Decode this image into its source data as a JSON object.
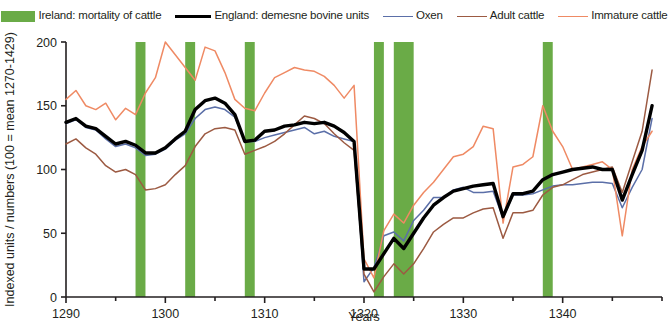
{
  "legend": {
    "items": [
      {
        "label": "Ireland: mortality of cattle",
        "marker": "swatch",
        "color": "#6aab47"
      },
      {
        "label": "England: demesne bovine units",
        "marker": "thick-line",
        "color": "#000000"
      },
      {
        "label": "Oxen",
        "marker": "thin-line",
        "color": "#5b6fa8"
      },
      {
        "label": "Adult cattle",
        "marker": "thin-line",
        "color": "#9c5a42"
      },
      {
        "label": "Immature cattle",
        "marker": "thin-line",
        "color": "#ef8a64"
      }
    ]
  },
  "chart_data": {
    "type": "line",
    "title": "",
    "xlabel": "Years",
    "ylabel": "Indexed units / numbers (100 = mean 1270-1429)",
    "xlim": [
      1290,
      1350
    ],
    "ylim": [
      0,
      200
    ],
    "xticks": [
      1290,
      1300,
      1310,
      1320,
      1330,
      1340
    ],
    "xminorticks": [
      1295,
      1305,
      1315,
      1325,
      1335,
      1345
    ],
    "yticks": [
      0,
      50,
      100,
      150,
      200
    ],
    "grid": false,
    "legend_position": "top",
    "x": [
      1290,
      1291,
      1292,
      1293,
      1294,
      1295,
      1296,
      1297,
      1298,
      1299,
      1300,
      1301,
      1302,
      1303,
      1304,
      1305,
      1306,
      1307,
      1308,
      1309,
      1310,
      1311,
      1312,
      1313,
      1314,
      1315,
      1316,
      1317,
      1318,
      1319,
      1320,
      1321,
      1322,
      1323,
      1324,
      1325,
      1326,
      1327,
      1328,
      1329,
      1330,
      1331,
      1332,
      1333,
      1334,
      1335,
      1336,
      1337,
      1338,
      1339,
      1340,
      1341,
      1342,
      1343,
      1344,
      1345,
      1346,
      1347,
      1348,
      1349
    ],
    "series": [
      {
        "name": "England: demesne bovine units",
        "color": "#000000",
        "width": 3.4,
        "values": [
          137,
          140,
          134,
          132,
          126,
          120,
          122,
          119,
          113,
          113,
          117,
          124,
          130,
          147,
          154,
          156,
          152,
          143,
          122,
          123,
          130,
          131,
          134,
          135,
          137,
          136,
          137,
          134,
          129,
          122,
          22,
          22,
          34,
          46,
          38,
          50,
          62,
          72,
          78,
          83,
          85,
          87,
          88,
          89,
          63,
          81,
          81,
          83,
          92,
          96,
          98,
          100,
          101,
          102,
          100,
          100,
          76,
          96,
          115,
          150
        ]
      },
      {
        "name": "Oxen",
        "color": "#5b6fa8",
        "width": 1.5,
        "values": [
          136,
          139,
          133,
          131,
          124,
          118,
          120,
          117,
          111,
          112,
          116,
          123,
          128,
          140,
          147,
          149,
          147,
          141,
          122,
          122,
          125,
          127,
          129,
          131,
          133,
          128,
          130,
          126,
          124,
          122,
          12,
          23,
          48,
          51,
          44,
          60,
          68,
          78,
          78,
          84,
          86,
          82,
          82,
          83,
          62,
          80,
          80,
          81,
          84,
          87,
          88,
          88,
          89,
          90,
          90,
          89,
          70,
          86,
          100,
          140
        ]
      },
      {
        "name": "Adult cattle",
        "color": "#9c5a42",
        "width": 1.5,
        "values": [
          120,
          124,
          117,
          112,
          103,
          98,
          100,
          96,
          84,
          85,
          88,
          96,
          103,
          118,
          128,
          132,
          133,
          131,
          112,
          115,
          118,
          122,
          128,
          135,
          142,
          140,
          136,
          128,
          121,
          115,
          18,
          4,
          16,
          26,
          18,
          26,
          38,
          51,
          57,
          62,
          62,
          66,
          69,
          70,
          46,
          66,
          66,
          68,
          80,
          86,
          88,
          92,
          96,
          98,
          100,
          102,
          82,
          106,
          130,
          178
        ]
      },
      {
        "name": "Immature cattle",
        "color": "#ef8a64",
        "width": 1.5,
        "values": [
          155,
          162,
          150,
          147,
          152,
          139,
          148,
          143,
          160,
          172,
          200,
          190,
          180,
          170,
          196,
          193,
          176,
          155,
          148,
          146,
          160,
          172,
          176,
          180,
          178,
          177,
          173,
          166,
          156,
          166,
          30,
          15,
          52,
          65,
          58,
          72,
          82,
          90,
          100,
          110,
          112,
          118,
          134,
          132,
          58,
          102,
          104,
          110,
          150,
          130,
          118,
          100,
          102,
          104,
          106,
          100,
          48,
          100,
          118,
          130
        ]
      }
    ],
    "bands": {
      "name": "Ireland: mortality of cattle",
      "color": "#6aab47",
      "ranges": [
        [
          1297,
          1298
        ],
        [
          1302,
          1303
        ],
        [
          1308,
          1309
        ],
        [
          1321,
          1322
        ],
        [
          1323,
          1325
        ],
        [
          1338,
          1339
        ]
      ]
    }
  }
}
